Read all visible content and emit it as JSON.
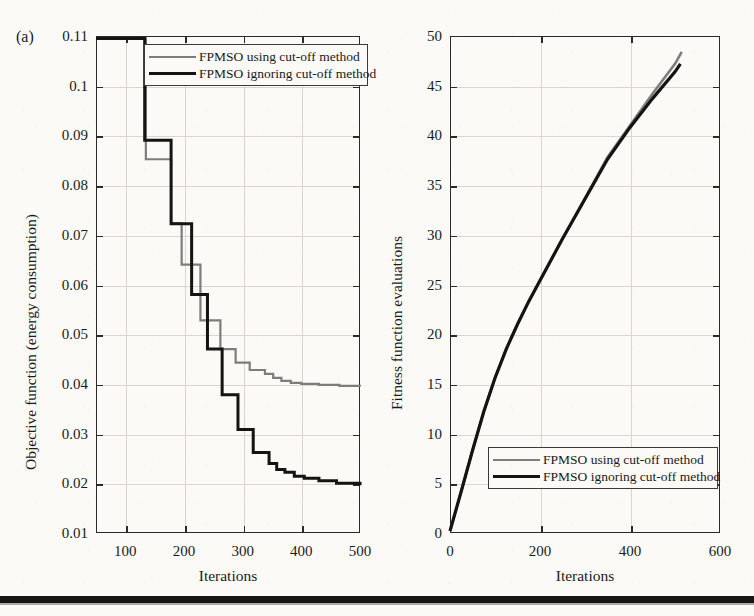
{
  "figure": {
    "panel_tag": "(a)",
    "background_color": "#fbfaf6",
    "series_colors": {
      "using_cutoff": "#7d7d7d",
      "ignoring_cutoff": "#141414"
    }
  },
  "legend": {
    "entries": [
      {
        "label": "FPMSO using cut-off method",
        "color": "#7d7d7d"
      },
      {
        "label": "FPMSO ignoring cut-off method",
        "color": "#141414"
      }
    ]
  },
  "chart_data": [
    {
      "type": "line",
      "id": "objective-function-vs-iterations",
      "title": "",
      "xlabel": "Iterations",
      "ylabel": "Objective function (energy consumption)",
      "xlim": [
        50,
        500
      ],
      "ylim": [
        0.01,
        0.11
      ],
      "xticks": [
        100,
        200,
        300,
        400,
        500
      ],
      "yticks": [
        0.01,
        0.02,
        0.03,
        0.04,
        0.05,
        0.06,
        0.07,
        0.08,
        0.09,
        0.1,
        0.11
      ],
      "xtick_labels": [
        "100",
        "200",
        "300",
        "400",
        "500"
      ],
      "ytick_labels": [
        "0.01",
        "0.02",
        "0.03",
        "0.04",
        "0.05",
        "0.06",
        "0.07",
        "0.08",
        "0.09",
        "0.1",
        "0.11"
      ],
      "grid": true,
      "drawstyle": "steps-post",
      "legend_position": "upper-center",
      "series": [
        {
          "name": "FPMSO using cut-off method",
          "color": "#7d7d7d",
          "x": [
            50,
            135,
            160,
            178,
            196,
            215,
            228,
            243,
            262,
            272,
            288,
            300,
            312,
            325,
            338,
            352,
            366,
            382,
            400,
            430,
            465,
            500
          ],
          "y": [
            0.1095,
            0.0852,
            0.0852,
            0.0723,
            0.064,
            0.064,
            0.0528,
            0.0528,
            0.047,
            0.047,
            0.0443,
            0.0443,
            0.0428,
            0.0428,
            0.042,
            0.0412,
            0.0406,
            0.0402,
            0.04,
            0.0398,
            0.0396,
            0.0395
          ]
        },
        {
          "name": "FPMSO ignoring cut-off method",
          "color": "#141414",
          "x": [
            50,
            133,
            155,
            178,
            196,
            213,
            228,
            240,
            252,
            265,
            278,
            292,
            305,
            318,
            330,
            345,
            358,
            372,
            388,
            405,
            430,
            460,
            500
          ],
          "y": [
            0.1095,
            0.089,
            0.089,
            0.0722,
            0.0722,
            0.058,
            0.058,
            0.047,
            0.047,
            0.0378,
            0.0378,
            0.0308,
            0.0308,
            0.0262,
            0.0262,
            0.024,
            0.0228,
            0.0222,
            0.0214,
            0.021,
            0.0205,
            0.02,
            0.0196
          ]
        }
      ]
    },
    {
      "type": "line",
      "id": "fitness-function-evaluations-vs-iterations",
      "title": "",
      "xlabel": "Iterations",
      "ylabel": "Fitness function evaluations",
      "xlim": [
        0,
        600
      ],
      "ylim": [
        0,
        50
      ],
      "xticks": [
        0,
        200,
        400,
        600
      ],
      "yticks": [
        0,
        5,
        10,
        15,
        20,
        25,
        30,
        35,
        40,
        45,
        50
      ],
      "xtick_labels": [
        "0",
        "200",
        "400",
        "600"
      ],
      "ytick_labels": [
        "0",
        "5",
        "10",
        "15",
        "20",
        "25",
        "30",
        "35",
        "40",
        "45",
        "50"
      ],
      "grid": true,
      "drawstyle": "line",
      "legend_position": "lower-center",
      "series": [
        {
          "name": "FPMSO using cut-off method",
          "color": "#7d7d7d",
          "x": [
            0,
            25,
            50,
            75,
            100,
            125,
            150,
            175,
            200,
            250,
            300,
            350,
            400,
            450,
            500,
            515
          ],
          "y": [
            0.2,
            4.2,
            8.3,
            12.2,
            15.6,
            18.5,
            21.0,
            23.3,
            25.4,
            29.6,
            33.7,
            37.8,
            41.0,
            44.2,
            47.2,
            48.4
          ]
        },
        {
          "name": "FPMSO ignoring cut-off method",
          "color": "#141414",
          "x": [
            0,
            25,
            50,
            75,
            100,
            125,
            150,
            175,
            200,
            250,
            300,
            350,
            400,
            450,
            500,
            512
          ],
          "y": [
            0.2,
            4.2,
            8.3,
            12.2,
            15.6,
            18.5,
            21.0,
            23.3,
            25.4,
            29.6,
            33.6,
            37.6,
            40.8,
            43.7,
            46.4,
            47.2
          ]
        }
      ]
    }
  ]
}
